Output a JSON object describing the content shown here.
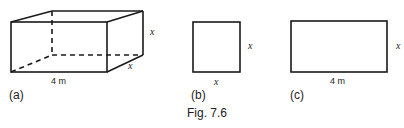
{
  "figure": {
    "caption": "Fig. 7.6",
    "colors": {
      "stroke": "#1a1a1a",
      "background": "#ffffff"
    },
    "panels": [
      {
        "id": "a",
        "label": "(a)",
        "shape": "cuboid",
        "length_label": "4 m",
        "height_label": "x",
        "depth_label": "x"
      },
      {
        "id": "b",
        "label": "(b)",
        "shape": "square",
        "side_label": "x",
        "bottom_label": "x"
      },
      {
        "id": "c",
        "label": "(c)",
        "shape": "rectangle",
        "side_label": "x",
        "bottom_label": "4 m"
      }
    ]
  }
}
